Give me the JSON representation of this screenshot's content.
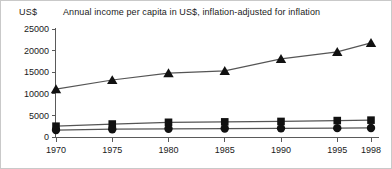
{
  "figure": {
    "unit_label": "US$",
    "title": "Annual income per capita in US$, inflation-adjusted for inflation"
  },
  "axes": {
    "y_ticks": [
      "0",
      "5000",
      "10000",
      "15000",
      "20000",
      "25000"
    ],
    "x_ticks": [
      "1970",
      "1975",
      "1980",
      "1985",
      "1990",
      "1995",
      "1998"
    ]
  },
  "chart_data": {
    "type": "line",
    "title": "Annual income per capita in US$, inflation-adjusted for inflation",
    "xlabel": "",
    "ylabel": "US$",
    "categories": [
      "1970",
      "1975",
      "1980",
      "1985",
      "1990",
      "1995",
      "1998"
    ],
    "x": [
      1970,
      1975,
      1980,
      1985,
      1990,
      1995,
      1998
    ],
    "ylim": [
      0,
      25000
    ],
    "yticks": [
      0,
      5000,
      10000,
      15000,
      20000,
      25000
    ],
    "grid": false,
    "legend": "none",
    "series": [
      {
        "name": "triangle-series",
        "marker": "triangle",
        "values": [
          11100,
          13200,
          14800,
          15300,
          18100,
          19700,
          21800
        ]
      },
      {
        "name": "square-series",
        "marker": "square",
        "values": [
          2500,
          3000,
          3400,
          3500,
          3600,
          3800,
          3900
        ]
      },
      {
        "name": "circle-series",
        "marker": "circle",
        "values": [
          1600,
          1800,
          1900,
          1950,
          2000,
          2050,
          2100
        ]
      }
    ]
  }
}
